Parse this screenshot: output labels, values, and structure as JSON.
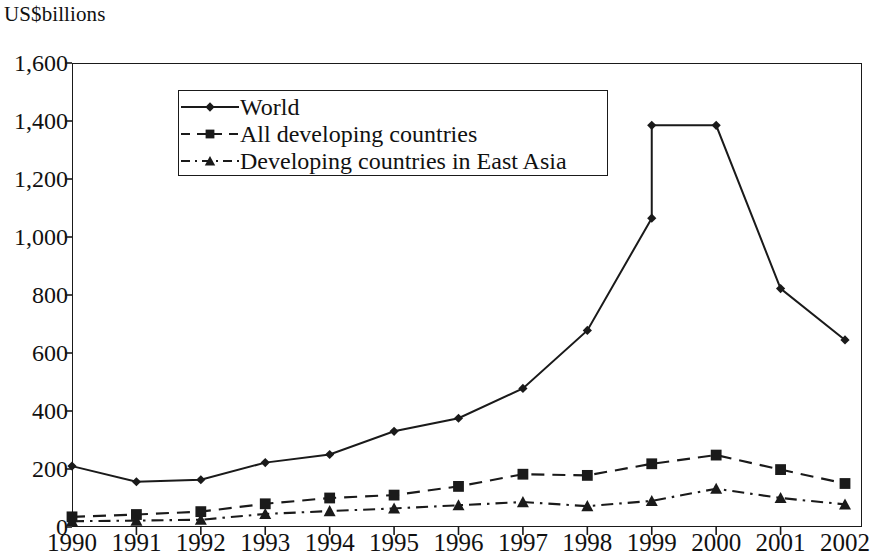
{
  "chart_data": {
    "type": "line",
    "title": "",
    "ylabel": "US$billions",
    "xlabel": "",
    "x": [
      1990,
      1991,
      1992,
      1993,
      1994,
      1995,
      1996,
      1997,
      1998,
      1999,
      2000,
      2001,
      2002
    ],
    "categories": [
      "1990",
      "1991",
      "1992",
      "1993",
      "1994",
      "1995",
      "1996",
      "1997",
      "1998",
      "1999",
      "2000",
      "2001",
      "2002"
    ],
    "ylim": [
      0,
      1600
    ],
    "yticks": [
      0,
      200,
      400,
      600,
      800,
      1000,
      1200,
      1400,
      1600
    ],
    "ytick_labels": [
      "0",
      "200",
      "400",
      "600",
      "800",
      "1,000",
      "1,200",
      "1,400",
      "1,600"
    ],
    "grid": false,
    "legend_position": "upper-left-inside",
    "series": [
      {
        "name": "World",
        "marker": "diamond",
        "line_style": "solid",
        "color": "#1a1a1a",
        "values": [
          210,
          156,
          163,
          222,
          250,
          330,
          375,
          478,
          678,
          1065,
          1385,
          822,
          645
        ],
        "note": "At 1999 the line shows a near-vertical jump from 1,065 to 1,385"
      },
      {
        "name": "All developing countries",
        "marker": "square",
        "line_style": "dashed",
        "color": "#1a1a1a",
        "values": [
          35,
          43,
          53,
          80,
          100,
          110,
          140,
          182,
          178,
          218,
          248,
          198,
          150
        ]
      },
      {
        "name": "Developing countries in East Asia",
        "marker": "triangle",
        "line_style": "dash-dot",
        "color": "#1a1a1a",
        "values": [
          20,
          22,
          25,
          45,
          55,
          64,
          75,
          86,
          72,
          90,
          132,
          100,
          78
        ]
      }
    ]
  },
  "axis": {
    "unit_title": "US$billions"
  },
  "legend": {
    "items": [
      {
        "label": "World"
      },
      {
        "label": "All developing countries"
      },
      {
        "label": "Developing countries in East Asia"
      }
    ]
  }
}
